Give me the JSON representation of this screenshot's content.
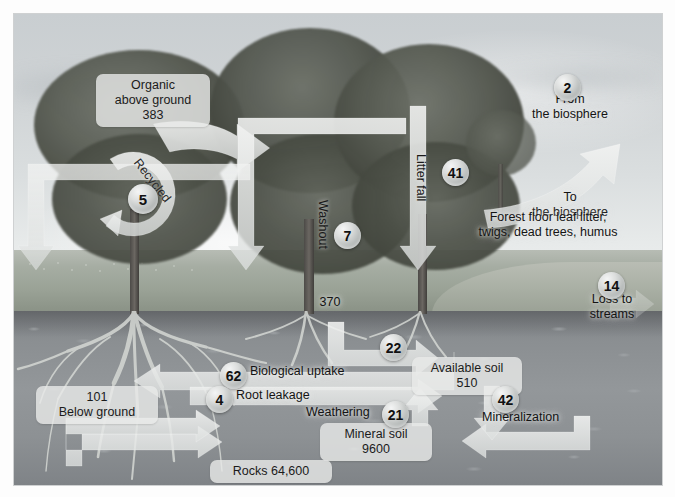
{
  "diagram": {
    "pools": [
      {
        "id": "organic-above-ground",
        "name": "Organic above ground",
        "line1": "Organic",
        "line2": "above ground",
        "value": "383"
      },
      {
        "id": "below-ground",
        "name": "Below ground",
        "line1": "101",
        "line2": "Below ground",
        "value": "101"
      },
      {
        "id": "available-soil",
        "name": "Available soil",
        "line1": "Available soil",
        "line2": "510",
        "value": "510"
      },
      {
        "id": "mineral-soil",
        "name": "Mineral soil",
        "line1": "Mineral soil",
        "line2": "9600",
        "value": "9600"
      },
      {
        "id": "rocks",
        "name": "Rocks",
        "line1": "Rocks  64,600",
        "line2": "",
        "value": "64,600"
      }
    ],
    "flows": [
      {
        "id": "from-biosphere",
        "badge": "2",
        "line1": "From",
        "line2": "the biosphere"
      },
      {
        "id": "to-biosphere",
        "badge": "",
        "line1": "To",
        "line2": "the biosphere"
      },
      {
        "id": "litter-fall",
        "badge": "41",
        "label": "Litter fall"
      },
      {
        "id": "washout",
        "badge": "7",
        "label": "Washout",
        "sublabel": "370"
      },
      {
        "id": "recycled",
        "badge": "5",
        "label": "Recycled"
      },
      {
        "id": "loss-to-streams",
        "badge": "14",
        "line1": "Loss to",
        "line2": "streams"
      },
      {
        "id": "leaching",
        "badge": "22",
        "label": ""
      },
      {
        "id": "biological-uptake",
        "badge": "62",
        "label": "Biological uptake"
      },
      {
        "id": "root-leakage",
        "badge": "4",
        "label": "Root leakage"
      },
      {
        "id": "weathering",
        "badge": "21",
        "label": "Weathering"
      },
      {
        "id": "mineralization",
        "badge": "42",
        "label": "Mineralization"
      }
    ],
    "annotations": [
      {
        "id": "forest-floor-note",
        "line1": "Forest floor leaf litter,",
        "line2": "twigs, dead trees, humus"
      }
    ],
    "colors": {
      "arrow_fill": "#e9ebea",
      "badge_face": "#d9dcdb",
      "label_bg": "#e8eae9",
      "text": "#141414",
      "soil": "#8d9194",
      "sky": "#d3d7d9"
    }
  }
}
